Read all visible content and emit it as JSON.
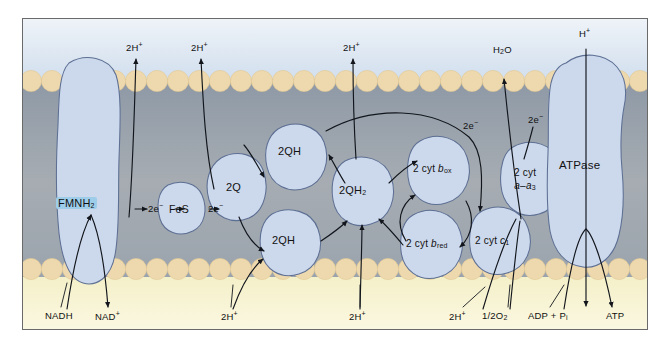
{
  "figure": {
    "membrane": {
      "outer_space_label": "intermembrane-space",
      "inner_space_label": "matrix",
      "colors": {
        "outer_fluid": "#dfe8f2",
        "lipid_head": "#efd9ae",
        "bilayer_core": "#9aa2ab",
        "inner_fluid": "#f6f2cf",
        "protein_fill": "#ccd8ec",
        "protein_stroke": "#5d6f93",
        "highlight": "#9ecdea",
        "frame": "#6a6a6a"
      }
    },
    "complexes": [
      {
        "id": "complex-i",
        "label": "FMNH2",
        "label_text": "FMNH",
        "sub": "2",
        "highlight": true
      },
      {
        "id": "fes",
        "label": "FeS"
      },
      {
        "id": "two-q",
        "label": "2Q"
      },
      {
        "id": "two-qh-top",
        "label": "2QH"
      },
      {
        "id": "two-qh-bot",
        "label": "2QH"
      },
      {
        "id": "two-qh2",
        "label": "2QH2",
        "label_text": "2QH",
        "sub": "2"
      },
      {
        "id": "cyt-b-ox",
        "label_prefix": "2 cyt ",
        "italic": "b",
        "sub": "ox"
      },
      {
        "id": "cyt-b-red",
        "label_prefix": "2 cyt ",
        "italic": "b",
        "sub": "red"
      },
      {
        "id": "cyt-c1",
        "label_prefix": "2 cyt ",
        "italic": "c",
        "sub": "1"
      },
      {
        "id": "cyt-a-a3",
        "line1": "2 cyt",
        "line2_italic": "a–a",
        "line2_sub": "3"
      },
      {
        "id": "atpase",
        "label": "ATPase"
      }
    ],
    "electron_labels": [
      {
        "id": "e1",
        "text": "2e",
        "sup": "−"
      },
      {
        "id": "e2",
        "text": "2e",
        "sup": "−"
      },
      {
        "id": "e3",
        "text": "2e",
        "sup": "−"
      },
      {
        "id": "e4",
        "text": "2e",
        "sup": "−"
      }
    ],
    "top_labels": [
      {
        "id": "top-2h-1",
        "text": "2H",
        "sup": "+"
      },
      {
        "id": "top-2h-2",
        "text": "2H",
        "sup": "+"
      },
      {
        "id": "top-2h-3",
        "text": "2H",
        "sup": "+"
      },
      {
        "id": "top-h2o",
        "text": "H",
        "sub": "2",
        "tail": "O"
      },
      {
        "id": "top-h",
        "text": "H",
        "sup": "+"
      }
    ],
    "bottom_labels": [
      {
        "id": "bot-nadh",
        "text": "NADH"
      },
      {
        "id": "bot-nad",
        "text": "NAD",
        "sup": "+"
      },
      {
        "id": "bot-2h-1",
        "text": "2H",
        "sup": "+"
      },
      {
        "id": "bot-2h-2",
        "text": "2H",
        "sup": "+"
      },
      {
        "id": "bot-2h-3",
        "text": "2H",
        "sup": "+"
      },
      {
        "id": "bot-o2",
        "text": "1/2O",
        "sub": "2"
      },
      {
        "id": "bot-adp",
        "text": "ADP + P",
        "sub": "i"
      },
      {
        "id": "bot-atp",
        "text": "ATP"
      }
    ]
  }
}
